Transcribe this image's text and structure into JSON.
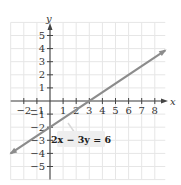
{
  "chart_data": {
    "type": "line",
    "title": "",
    "xlabel": "x",
    "ylabel": "y",
    "xlim": [
      -3,
      8.8
    ],
    "ylim": [
      -6,
      6
    ],
    "grid": true,
    "x_ticks": [
      -2,
      -1,
      1,
      2,
      3,
      4,
      5,
      6,
      7,
      8
    ],
    "y_ticks": [
      5,
      4,
      3,
      2,
      1,
      -1,
      -2,
      -3,
      -4,
      -5
    ],
    "x_tick_labels": [
      "−2",
      "−1",
      "1",
      "2",
      "3",
      "4",
      "5",
      "6",
      "7",
      "8"
    ],
    "y_tick_labels": [
      "5",
      "4",
      "3",
      "2",
      "1",
      "−1",
      "−2",
      "−3",
      "−4",
      "−5"
    ],
    "series": [
      {
        "name": "2x − 3y = 6",
        "equation": "2x − 3y = 6",
        "slope": 0.6667,
        "intercept": -2,
        "x": [
          -3,
          0,
          3,
          6,
          8.8
        ],
        "y": [
          -4,
          -2,
          0,
          2,
          3.87
        ]
      }
    ],
    "annotations": [
      {
        "text": "2x − 3y = 6",
        "x": 1.5,
        "y": -3
      }
    ]
  },
  "colors": {
    "grid": "#e6e6e6",
    "axis": "#444444",
    "line": "#8c8c8c",
    "label_box": "#eeeeee"
  }
}
